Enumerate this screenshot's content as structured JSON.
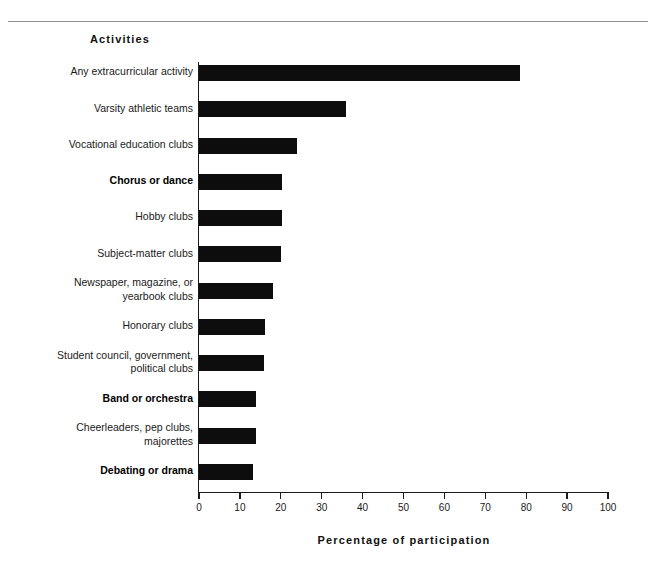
{
  "header": {
    "rule": "horizontal-rule"
  },
  "chart_data": {
    "type": "bar",
    "orientation": "horizontal",
    "title": "Activities",
    "xlabel": "Percentage  of  participation",
    "ylabel": "",
    "xlim": [
      0,
      100
    ],
    "xticks": [
      0,
      10,
      20,
      30,
      40,
      50,
      60,
      70,
      80,
      90,
      100
    ],
    "xtick_labels": [
      "0",
      "10",
      "20",
      "30",
      "40",
      "50",
      "60",
      "70",
      "80",
      "90",
      "100"
    ],
    "grid": false,
    "legend": false,
    "bar_color": "#0d0d0d",
    "axis_color": "#1a1a1a",
    "categories": [
      "Any extracurricular activity",
      "Varsity athletic teams",
      "Vocational education clubs",
      "Chorus or dance",
      "Hobby clubs",
      "Subject-matter clubs",
      "Newspaper, magazine, or yearbook clubs",
      "Honorary clubs",
      "Student council, government, political clubs",
      "Band or orchestra",
      "Cheerleaders, pep clubs, majorettes",
      "Debating or drama"
    ],
    "category_lines": [
      [
        "Any extracurricular activity"
      ],
      [
        "Varsity athletic teams"
      ],
      [
        "Vocational education clubs"
      ],
      [
        "Chorus or dance"
      ],
      [
        "Hobby clubs"
      ],
      [
        "Subject-matter clubs"
      ],
      [
        "Newspaper, magazine, or",
        "yearbook clubs"
      ],
      [
        "Honorary clubs"
      ],
      [
        "Student council, government,",
        "political clubs"
      ],
      [
        "Band or orchestra"
      ],
      [
        "Cheerleaders, pep clubs,",
        "majorettes"
      ],
      [
        "Debating or drama"
      ]
    ],
    "category_emphasis": [
      false,
      false,
      false,
      true,
      false,
      false,
      false,
      false,
      false,
      true,
      false,
      true
    ],
    "values": [
      78.5,
      35.9,
      24.0,
      20.3,
      20.2,
      20.1,
      18.1,
      16.1,
      16.0,
      14.0,
      14.0,
      13.2
    ]
  }
}
